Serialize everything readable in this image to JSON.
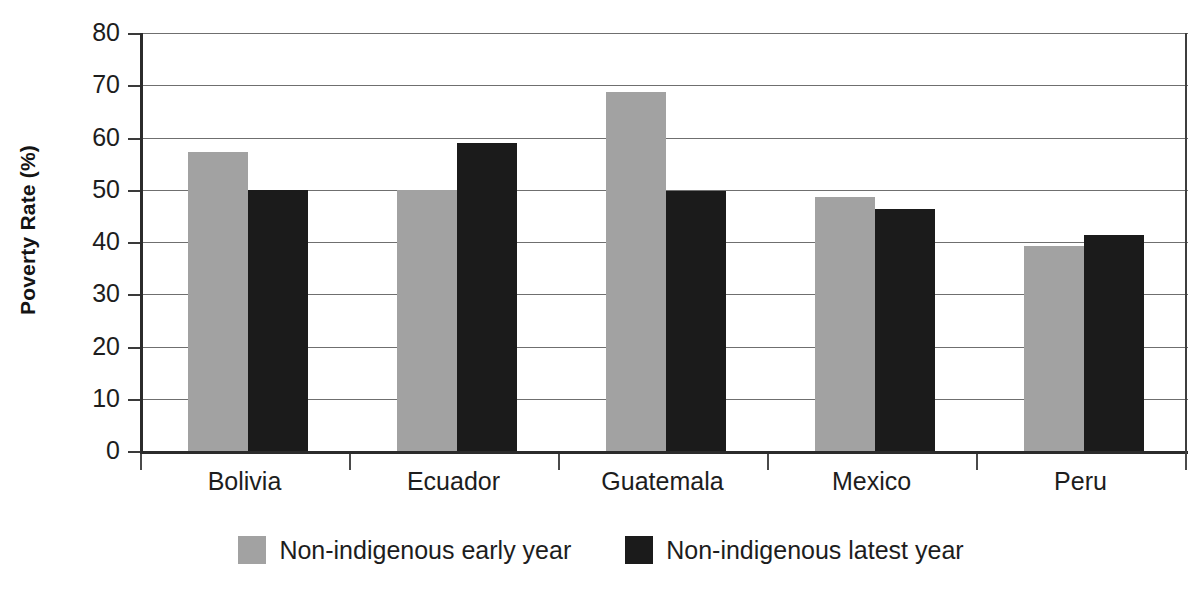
{
  "chart_data": {
    "type": "bar",
    "title": "",
    "subtitle": "",
    "xlabel": "",
    "ylabel": "Poverty Rate (%)",
    "ylim": [
      0,
      80
    ],
    "ytick_step": 10,
    "yticks": [
      80,
      70,
      60,
      50,
      40,
      30,
      20,
      10,
      0
    ],
    "grid": true,
    "legend_position": "bottom-center",
    "categories": [
      "Bolivia",
      "Ecuador",
      "Guatemala",
      "Mexico",
      "Peru"
    ],
    "series": [
      {
        "name": "Non-indigenous early year",
        "color": "#a2a2a2",
        "values": [
          57.2,
          50.0,
          68.8,
          48.6,
          39.2
        ]
      },
      {
        "name": "Non-indigenous latest year",
        "color": "#1b1b1b",
        "values": [
          50.0,
          59.0,
          49.7,
          46.3,
          41.3
        ]
      }
    ]
  },
  "axis": {
    "y_title": "Poverty Rate (%)"
  },
  "colors": {
    "early_year": "#a2a2a2",
    "latest_year": "#1b1b1b",
    "axis_line": "#2b2b2b",
    "gridline": "#6f6f6f",
    "background": "#ffffff",
    "text": "#1d1d1d"
  }
}
